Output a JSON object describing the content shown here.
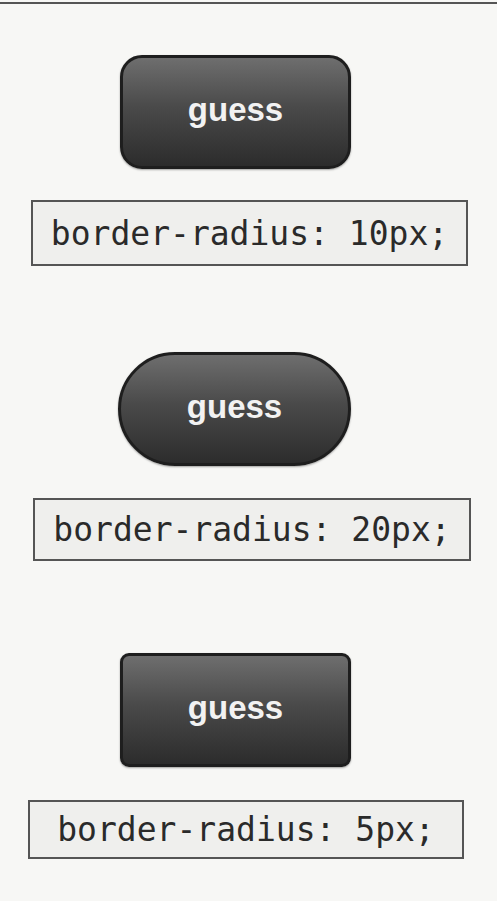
{
  "examples": [
    {
      "button_label": "guess",
      "css_label": "border-radius: 10px;"
    },
    {
      "button_label": "guess",
      "css_label": "border-radius: 20px;"
    },
    {
      "button_label": "guess",
      "css_label": "border-radius: 5px;"
    }
  ],
  "colors": {
    "button_gradient_top": "#6e6e6e",
    "button_gradient_bottom": "#2c2c2c",
    "button_border": "#1e1e1e",
    "button_text": "#f2f2f2",
    "code_box_border": "#555555",
    "code_box_fill": "#efefed",
    "page_background": "#f7f7f5"
  }
}
